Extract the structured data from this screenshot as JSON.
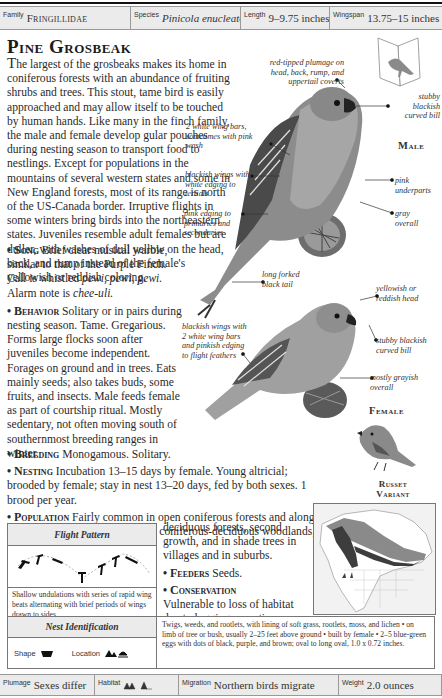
{
  "header": {
    "family_label": "Family",
    "family_value": "Fringillidae",
    "species_label": "Species",
    "species_value": "Pinicola enucleator",
    "length_label": "Length",
    "length_value": "9–9.75 inches",
    "wingspan_label": "Wingspan",
    "wingspan_value": "13.75–15 inches"
  },
  "title": "Pine Grosbeak",
  "intro": {
    "lead": "T",
    "text": "he largest of the grosbeaks makes its home in coniferous forests with an abundance of fruiting shrubs and trees. This stout, tame bird is easily approached and may allow itself to be touched by human hands. Like many in the finch family, the male and female develop gular pouches during nesting season to transport food to nestlings. Except for populations in the mountains of several western states and some in New England forests, most of its range is north of the US-Canada border. Irruptive flights in some winters bring birds into the northeastern states. Juveniles resemble adult females but are duller, with washes of dull yellow on the head, back, and rump instead of the female's yellowish or reddish coloring."
  },
  "sections": {
    "song": {
      "label": "Song",
      "text_a": " Brief clear musical warble, similar to that of the Purple Finch. Call is whistled ",
      "call": "pewi, pewi, pewi.",
      "text_b": " Alarm note is ",
      "alarm": "chee-uli."
    },
    "behavior": {
      "label": "Behavior",
      "text": " Solitary or in pairs during nesting season. Tame. Gregarious. Forms large flocks soon after juveniles become independent. Forages on ground and in trees. Eats mainly seeds; also takes buds, some fruits, and insects. Male feeds female as part of courtship ritual. Mostly sedentary, not often moving south of southernmost breeding ranges in winter."
    },
    "breeding": {
      "label": "Breeding",
      "text": " Monogamous. Solitary."
    },
    "nesting": {
      "label": "Nesting",
      "text": " Incubation 13–15 days by female. Young altricial; brooded by female; stay in nest 13–20 days, fed by both sexes. 1 brood per year."
    },
    "population": {
      "label": "Population",
      "text_a": " Fairly common in open coniferous forests and along edge of forest. Winters in mixed coniferous-deciduous woodlands,",
      "text_b": "deciduous forests, second growth, and in shade trees in villages and in suburbs."
    },
    "feeders": {
      "label": "Feeders",
      "text": " Seeds."
    },
    "conservation": {
      "label": "Conservation",
      "text": "Vulnerable to loss of habitat due to logging operations."
    }
  },
  "male_annotations": {
    "plumage": "red-tipped plumage on head, back, rump, and uppertail coverts",
    "bill": "stubby blackish curved bill",
    "wingbars": "2 white wing bars, sometimes with pink wash",
    "wings": "blackish wings with white edging to tertials",
    "underparts": "pink underparts",
    "edging": "pink edging to primaries and secondaries",
    "overall": "gray overall",
    "tail": "long forked black tail",
    "label": "Male"
  },
  "female_annotations": {
    "head": "yellowish or reddish head",
    "wings": "blackish wings with 2 white wing bars and pinkish edging to flight feathers",
    "bill": "stubby blackish curved bill",
    "overall": "mostly grayish overall",
    "label": "Female"
  },
  "variant_label_1": "Russet",
  "variant_label_2": "variant",
  "flight_pattern": {
    "title": "Flight Pattern",
    "description": "Shallow undulations with series of rapid wing beats alternating with brief periods of wings drawn to sides."
  },
  "nest_identification": {
    "title": "Nest Identification",
    "shape_label": "Shape",
    "location_label": "Location",
    "description": "Twigs, weeds, and rootlets, with lining of soft grass, rootlets, moss, and lichen • on limb of tree or bush, usually 2–25 feet above ground • built by female • 2–5 blue-green eggs with dots of black, purple, and brown; oval to long oval, 1.0 x 0.72 inches."
  },
  "footer": {
    "plumage_label": "Plumage",
    "plumage_value": "Sexes differ",
    "habitat_label": "Habitat",
    "migration_label": "Migration",
    "migration_value": "Northern birds migrate",
    "weight_label": "Weight",
    "weight_value": "2.0 ounces"
  },
  "colors": {
    "header_bg": "#ebebeb",
    "border": "#999999",
    "range_dark": "#3d3d3d",
    "range_light": "#8a8a8a"
  }
}
